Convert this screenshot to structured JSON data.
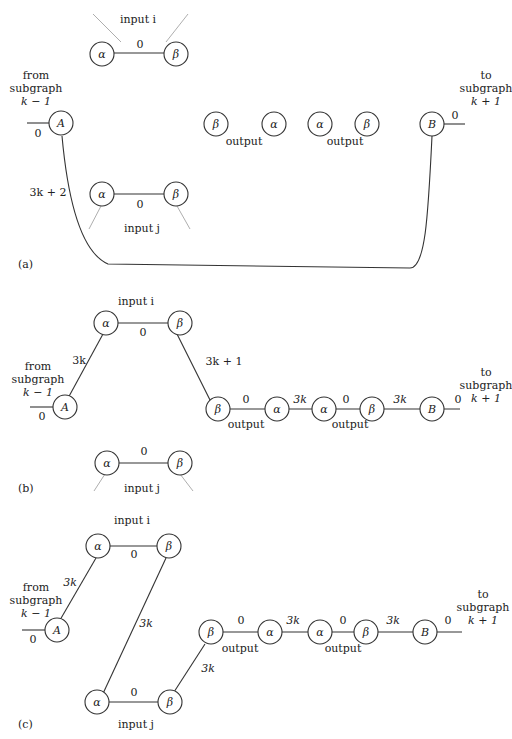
{
  "figure": {
    "panels": [
      {
        "id": "a",
        "panel_label": "(a)",
        "input_i": {
          "label": "input i",
          "alpha": "α",
          "beta": "β",
          "edge_weight": "0"
        },
        "input_j": {
          "label": "input j",
          "alpha": "α",
          "beta": "β",
          "edge_weight": "0"
        },
        "from": {
          "lines": [
            "from",
            "subgraph",
            "k − 1"
          ],
          "node": "A",
          "stub_weight": "0"
        },
        "to": {
          "lines": [
            "to",
            "subgraph",
            "k + 1"
          ],
          "node": "B",
          "stub_weight": "0"
        },
        "outputs": [
          {
            "label": "output",
            "left": "β",
            "right": "α"
          },
          {
            "label": "output",
            "left": "α",
            "right": "β"
          }
        ],
        "long_edge_weight": "3k + 2"
      },
      {
        "id": "b",
        "panel_label": "(b)",
        "input_i": {
          "label": "input i",
          "alpha": "α",
          "beta": "β",
          "edge_weight": "0"
        },
        "input_j": {
          "label": "input j",
          "alpha": "α",
          "beta": "β",
          "edge_weight": "0"
        },
        "from": {
          "lines": [
            "from",
            "subgraph",
            "k − 1"
          ],
          "node": "A",
          "stub_weight": "0"
        },
        "to": {
          "lines": [
            "to",
            "subgraph",
            "k + 1"
          ],
          "node": "B",
          "stub_weight": "0"
        },
        "outputs": [
          {
            "label": "output",
            "left": "β",
            "right": "α",
            "edge_weight": "0"
          },
          {
            "label": "output",
            "left": "α",
            "right": "β",
            "edge_weight": "0"
          }
        ],
        "edge_A_alpha_i": "3k",
        "edge_beta_i_output": "3k + 1",
        "edge_between_outputs": "3k",
        "edge_output_B": "3k"
      },
      {
        "id": "c",
        "panel_label": "(c)",
        "input_i": {
          "label": "input i",
          "alpha": "α",
          "beta": "β",
          "edge_weight": "0"
        },
        "input_j": {
          "label": "input j",
          "alpha": "α",
          "beta": "β",
          "edge_weight": "0"
        },
        "from": {
          "lines": [
            "from",
            "subgraph",
            "k − 1"
          ],
          "node": "A",
          "stub_weight": "0"
        },
        "to": {
          "lines": [
            "to",
            "subgraph",
            "k + 1"
          ],
          "node": "B",
          "stub_weight": "0"
        },
        "outputs": [
          {
            "label": "output",
            "left": "β",
            "right": "α",
            "edge_weight": "0"
          },
          {
            "label": "output",
            "left": "α",
            "right": "β",
            "edge_weight": "0"
          }
        ],
        "edge_A_alpha_i": "3k",
        "edge_beta_i_alpha_j": "3k",
        "edge_beta_j_output": "3k",
        "edge_between_outputs": "3k",
        "edge_output_B": "3k"
      }
    ]
  }
}
